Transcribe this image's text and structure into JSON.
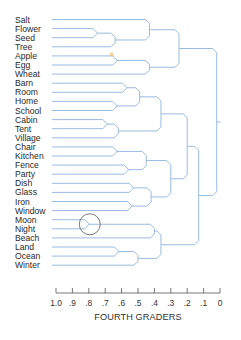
{
  "figure": {
    "axis_title": "FOURTH GRADERS",
    "axis_ticks": [
      "1.0",
      ".9",
      ".8",
      ".7",
      ".6",
      ".5",
      ".4",
      ".3",
      ".2",
      ".1",
      "0"
    ],
    "colors": {
      "branch": "#8fb3dc",
      "axis": "#555555",
      "text": "#2a2a2a",
      "highlight_circle": "#555555",
      "highlight_dot": "#f2c27a"
    }
  },
  "leaves": [
    "Salt",
    "Flower",
    "Seed",
    "Tree",
    "Apple",
    "Egg",
    "Wheat",
    "Barn",
    "Room",
    "Home",
    "School",
    "Cabin",
    "Tent",
    "Village",
    "Chair",
    "Kitchen",
    "Fence",
    "Party",
    "Dish",
    "Glass",
    "Iron",
    "Window",
    "Moon",
    "Night",
    "Beach",
    "Land",
    "Ocean",
    "Winter"
  ],
  "chart_data": {
    "type": "dendrogram",
    "title": "",
    "xlabel": "FOURTH GRADERS",
    "x_axis": {
      "ticks": [
        1.0,
        0.9,
        0.8,
        0.7,
        0.6,
        0.5,
        0.4,
        0.3,
        0.2,
        0.1,
        0.0
      ],
      "range": [
        1.0,
        0.0
      ]
    },
    "leaves": [
      "Salt",
      "Flower",
      "Seed",
      "Tree",
      "Apple",
      "Egg",
      "Wheat",
      "Barn",
      "Room",
      "Home",
      "School",
      "Cabin",
      "Tent",
      "Village",
      "Chair",
      "Kitchen",
      "Fence",
      "Party",
      "Dish",
      "Glass",
      "Iron",
      "Window",
      "Moon",
      "Night",
      "Beach",
      "Land",
      "Ocean",
      "Winter"
    ],
    "merges": [
      {
        "id": "n1",
        "children": [
          "Flower",
          "Seed"
        ],
        "height": 0.75
      },
      {
        "id": "n2",
        "children": [
          "n1",
          "Tree"
        ],
        "height": 0.64
      },
      {
        "id": "n3",
        "children": [
          "Salt",
          "n2"
        ],
        "height": 0.43
      },
      {
        "id": "n4",
        "children": [
          "Apple",
          "Egg"
        ],
        "height": 0.63
      },
      {
        "id": "n5",
        "children": [
          "n4",
          "Wheat"
        ],
        "height": 0.43
      },
      {
        "id": "n6",
        "children": [
          "n3",
          "n5"
        ],
        "height": 0.25
      },
      {
        "id": "n7",
        "children": [
          "Barn",
          "Room"
        ],
        "height": 0.57
      },
      {
        "id": "n8",
        "children": [
          "Home",
          "School"
        ],
        "height": 0.63
      },
      {
        "id": "n9",
        "children": [
          "n7",
          "n8"
        ],
        "height": 0.49
      },
      {
        "id": "n10",
        "children": [
          "Cabin",
          "Tent"
        ],
        "height": 0.69
      },
      {
        "id": "n11",
        "children": [
          "n10",
          "Village"
        ],
        "height": 0.62
      },
      {
        "id": "n12",
        "children": [
          "n9",
          "n11"
        ],
        "height": 0.36
      },
      {
        "id": "n13",
        "children": [
          "Chair",
          "Kitchen"
        ],
        "height": 0.63
      },
      {
        "id": "n14",
        "children": [
          "Fence",
          "Party"
        ],
        "height": 0.56
      },
      {
        "id": "n15",
        "children": [
          "n13",
          "n14"
        ],
        "height": 0.45
      },
      {
        "id": "n16",
        "children": [
          "Dish",
          "Glass"
        ],
        "height": 0.53
      },
      {
        "id": "n17",
        "children": [
          "Iron",
          "Window"
        ],
        "height": 0.54
      },
      {
        "id": "n18",
        "children": [
          "n16",
          "n17"
        ],
        "height": 0.42
      },
      {
        "id": "n19",
        "children": [
          "n15",
          "n18"
        ],
        "height": 0.3
      },
      {
        "id": "n20",
        "children": [
          "n12",
          "n19"
        ],
        "height": 0.2
      },
      {
        "id": "n21",
        "children": [
          "Moon",
          "Night"
        ],
        "height": 0.8
      },
      {
        "id": "n22",
        "children": [
          "n21",
          "Beach"
        ],
        "height": 0.4
      },
      {
        "id": "n23",
        "children": [
          "Land",
          "Ocean"
        ],
        "height": 0.62
      },
      {
        "id": "n24",
        "children": [
          "n23",
          "Winter"
        ],
        "height": 0.5
      },
      {
        "id": "n25",
        "children": [
          "n22",
          "n24"
        ],
        "height": 0.36
      },
      {
        "id": "n26",
        "children": [
          "n20",
          "n25"
        ],
        "height": 0.13
      },
      {
        "id": "n27",
        "children": [
          "n6",
          "n26"
        ],
        "height": 0.02
      }
    ],
    "annotations": [
      {
        "type": "circle",
        "target": "n21",
        "note": "Moon/Night merge circled"
      },
      {
        "type": "dot",
        "target": "n4",
        "note": "small orange mark near Apple/Egg merge"
      }
    ],
    "grid": false,
    "legend": null
  },
  "layout": {
    "label_x": 15,
    "leaf_line_start_x": 52,
    "first_row_y": 19.5,
    "row_step": 9.1,
    "axis_x_at_1": 56,
    "axis_x_at_0": 220,
    "axis_y": 293
  }
}
